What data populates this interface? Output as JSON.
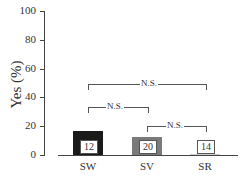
{
  "chart_data": {
    "type": "bar",
    "title": "",
    "xlabel": "",
    "ylabel": "Yes (%)",
    "ylim": [
      0,
      100
    ],
    "yticks": [
      "0",
      "20",
      "40",
      "60",
      "80",
      "100"
    ],
    "categories": [
      "SW",
      "SV",
      "SR"
    ],
    "values": [
      17,
      12.5,
      0.5
    ],
    "n_labels": [
      "12",
      "20",
      "14"
    ],
    "colors": [
      "#1a1a1a",
      "#7a7a7a",
      "#cccccc"
    ],
    "grid": false,
    "annotations": [
      {
        "from": "SW",
        "to": "SR",
        "label": "N.S."
      },
      {
        "from": "SW",
        "to": "SV",
        "label": "N.S."
      },
      {
        "from": "SV",
        "to": "SR",
        "label": "N.S."
      }
    ]
  }
}
